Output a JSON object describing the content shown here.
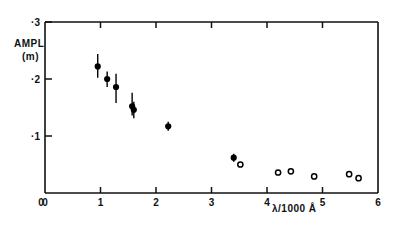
{
  "figure": {
    "ylabel_line1": "AMPL",
    "ylabel_line2": "(m)",
    "xlabel": "λ/1000 Å",
    "frame_color": "#111111",
    "marker_color": "#000000"
  },
  "chart_data": {
    "type": "scatter",
    "title": "",
    "xlabel": "λ/1000 Å",
    "ylabel": "AMPL (m)",
    "xlim": [
      0,
      6
    ],
    "ylim": [
      0,
      0.3
    ],
    "xticks": [
      0,
      1,
      2,
      3,
      4,
      5,
      6
    ],
    "xticklabels": [
      "0",
      "1",
      "2",
      "3",
      "4",
      "5",
      "6"
    ],
    "yticks": [
      0.1,
      0.2,
      0.3
    ],
    "yticklabels": [
      "·1",
      "·2",
      "·3"
    ],
    "grid": false,
    "legend": null,
    "series": [
      {
        "name": "filled-points",
        "marker": "filled-circle",
        "points": [
          {
            "x": 0.95,
            "y": 0.222,
            "yerr_lo": 0.02,
            "yerr_hi": 0.022
          },
          {
            "x": 1.12,
            "y": 0.2,
            "yerr_lo": 0.014,
            "yerr_hi": 0.013
          },
          {
            "x": 1.28,
            "y": 0.186,
            "yerr_lo": 0.028,
            "yerr_hi": 0.023
          },
          {
            "x": 1.57,
            "y": 0.152,
            "yerr_lo": 0.016,
            "yerr_hi": 0.024
          },
          {
            "x": 1.6,
            "y": 0.146,
            "yerr_lo": 0.015,
            "yerr_hi": 0.014
          },
          {
            "x": 2.22,
            "y": 0.117,
            "yerr_lo": 0.008,
            "yerr_hi": 0.008
          },
          {
            "x": 3.4,
            "y": 0.062,
            "yerr_lo": 0.007,
            "yerr_hi": 0.007
          }
        ]
      },
      {
        "name": "open-points",
        "marker": "open-circle",
        "points": [
          {
            "x": 3.52,
            "y": 0.05
          },
          {
            "x": 4.2,
            "y": 0.036
          },
          {
            "x": 4.43,
            "y": 0.038
          },
          {
            "x": 4.85,
            "y": 0.029
          },
          {
            "x": 5.48,
            "y": 0.033
          },
          {
            "x": 5.65,
            "y": 0.026
          }
        ]
      }
    ]
  }
}
